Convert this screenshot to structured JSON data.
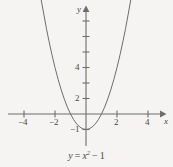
{
  "figure": {
    "caption": {
      "lhs": "y",
      "equals": "=",
      "var": "x",
      "exponent": "2",
      "minus": "−",
      "constant": "1",
      "full_text": "y = x² − 1"
    },
    "axes": {
      "x_axis_label": "x",
      "y_axis_label": "y",
      "line_color": "#6c6d70",
      "curve_color": "#6c6d70",
      "background_color": "#f5f4f2",
      "text_color": "#46474a"
    },
    "x_ticks": [
      {
        "value": -4,
        "label": "−4",
        "labeled": true
      },
      {
        "value": -3,
        "label": "",
        "labeled": false
      },
      {
        "value": -2,
        "label": "−2",
        "labeled": true
      },
      {
        "value": -1,
        "label": "",
        "labeled": false
      },
      {
        "value": 1,
        "label": "",
        "labeled": false
      },
      {
        "value": 2,
        "label": "2",
        "labeled": true
      },
      {
        "value": 3,
        "label": "",
        "labeled": false
      },
      {
        "value": 4,
        "label": "4",
        "labeled": true
      }
    ],
    "y_ticks": [
      {
        "value": -1,
        "label": "−1",
        "labeled": true
      },
      {
        "value": 1,
        "label": "",
        "labeled": false
      },
      {
        "value": 2,
        "label": "2",
        "labeled": true
      },
      {
        "value": 3,
        "label": "",
        "labeled": false
      },
      {
        "value": 4,
        "label": "4",
        "labeled": true
      },
      {
        "value": 5,
        "label": "",
        "labeled": false
      }
    ]
  },
  "chart_data": {
    "type": "line",
    "subtitle": "",
    "xlabel": "x",
    "ylabel": "y",
    "xlim": [
      -4.8,
      5.0
    ],
    "ylim": [
      -2.0,
      5.6
    ],
    "grid": false,
    "legend": "none",
    "xticks": [
      -4,
      -2,
      2,
      4
    ],
    "yticks": [
      -1,
      2,
      4
    ],
    "xticklabels": [
      "−4",
      "−2",
      "2",
      "4"
    ],
    "yticklabels": [
      "−1",
      "2",
      "4"
    ],
    "annotations": [
      {
        "text": "y = x² − 1",
        "position": "below-axes",
        "role": "caption"
      }
    ],
    "series": [
      {
        "name": "y = x² − 1",
        "equation": "y = x^2 - 1",
        "color": "#6c6d70",
        "vertex": [
          0,
          -1
        ],
        "roots": [
          -1,
          1
        ],
        "x": [
          -2.55,
          -2.4,
          -2.2,
          -2.0,
          -1.8,
          -1.6,
          -1.4,
          -1.2,
          -1.0,
          -0.8,
          -0.6,
          -0.4,
          -0.2,
          0.0,
          0.2,
          0.4,
          0.6,
          0.8,
          1.0,
          1.2,
          1.4,
          1.6,
          1.8,
          2.0,
          2.2,
          2.4,
          2.55
        ],
        "y": [
          5.5,
          4.76,
          3.84,
          3.0,
          2.24,
          1.56,
          0.96,
          0.44,
          0.0,
          -0.36,
          -0.64,
          -0.84,
          -0.96,
          -1.0,
          -0.96,
          -0.84,
          -0.64,
          -0.36,
          0.0,
          0.44,
          0.96,
          1.56,
          2.24,
          3.0,
          3.84,
          4.76,
          5.5
        ]
      }
    ]
  }
}
